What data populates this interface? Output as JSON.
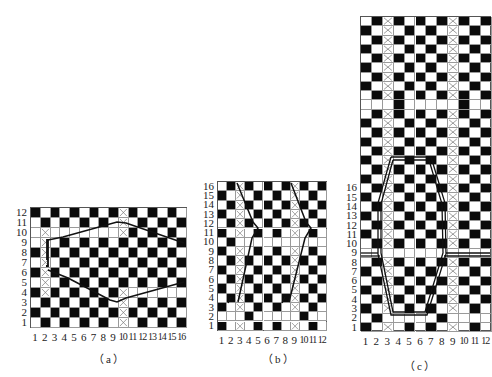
{
  "figure": {
    "panels": [
      {
        "id": "a",
        "caption": "（a）",
        "cols": 16,
        "rows": 12,
        "col_labels": [
          "1",
          "2",
          "3",
          "4",
          "5",
          "6",
          "7",
          "8",
          "9",
          "10",
          "11",
          "12",
          "13",
          "14",
          "15",
          "16"
        ],
        "row_labels": [
          "1",
          "2",
          "3",
          "4",
          "5",
          "6",
          "7",
          "8",
          "9",
          "10",
          "11",
          "12"
        ],
        "crossed_columns_note": "column 2 rows 4-10 and column 10 rows 1-4 & 10-12 crossed",
        "outline": "hexagonal float boundary spanning columns 2-16, rows 3-11"
      },
      {
        "id": "b",
        "caption": "（b）",
        "cols": 12,
        "rows": 16,
        "col_labels": [
          "1",
          "2",
          "3",
          "4",
          "5",
          "6",
          "7",
          "8",
          "9",
          "10",
          "11",
          "12"
        ],
        "row_labels": [
          "1",
          "2",
          "3",
          "4",
          "5",
          "6",
          "7",
          "8",
          "9",
          "10",
          "11",
          "12",
          "13",
          "14",
          "15",
          "16"
        ],
        "crossed_columns_note": "columns 3 and 9 crossed",
        "outline": "two zigzag lines beside columns 3 and 9, bending at row 10"
      },
      {
        "id": "c",
        "caption": "（c）",
        "cols": 12,
        "rows": 34,
        "col_labels": [
          "1",
          "2",
          "3",
          "4",
          "5",
          "6",
          "7",
          "8",
          "9",
          "10",
          "11",
          "12"
        ],
        "row_labels": [
          "1",
          "2",
          "3",
          "4",
          "5",
          "6",
          "7",
          "8",
          "9",
          "10",
          "11",
          "12",
          "13",
          "14",
          "15",
          "16"
        ],
        "crossed_columns_note": "columns 3 and 9 crossed",
        "outline": "double-line elongated hexagon spanning columns 3-9, rows 2-17, with horizontal double lines at row 8"
      }
    ]
  }
}
